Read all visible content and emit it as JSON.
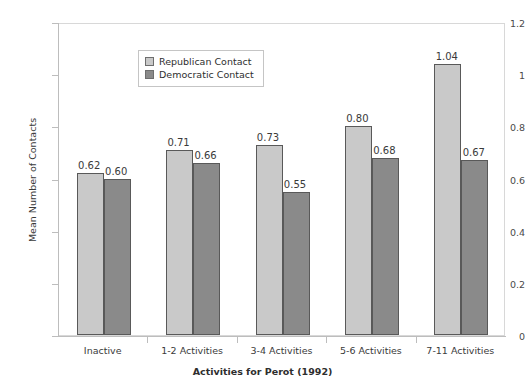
{
  "chart_data": {
    "type": "bar",
    "title": "",
    "subtitle": "",
    "xlabel": "Activities for Perot (1992)",
    "ylabel": "Mean Number of Contacts",
    "categories": [
      "Inactive",
      "1-2 Activities",
      "3-4 Activities",
      "5-6 Activities",
      "7-11 Activities"
    ],
    "series": [
      {
        "name": "Republican Contact",
        "color": "#c9c9c9",
        "values": [
          0.62,
          0.71,
          0.73,
          0.8,
          1.04
        ],
        "labels": [
          "0.62",
          "0.71",
          "0.73",
          "0.80",
          "1.04"
        ]
      },
      {
        "name": "Democratic Contact",
        "color": "#8a8a8a",
        "values": [
          0.6,
          0.66,
          0.55,
          0.68,
          0.67
        ],
        "labels": [
          "0.60",
          "0.66",
          "0.55",
          "0.68",
          "0.67"
        ]
      }
    ],
    "ylim": [
      0,
      1.2
    ],
    "yticks": [
      0,
      0.2,
      0.4,
      0.6,
      0.8,
      1,
      1.2
    ],
    "ytick_labels": [
      "0",
      "0.2",
      "0.4",
      "0.6",
      "0.8",
      "1",
      "1.2"
    ],
    "grid": false,
    "legend_position": "upper-left-inside",
    "bar_edge_color": "#595959",
    "axis_color": "#bdbdbd",
    "background": "#ffffff"
  },
  "legend": {
    "entries": [
      {
        "label": "Republican Contact",
        "swatch": "rep"
      },
      {
        "label": "Democratic Contact",
        "swatch": "dem"
      }
    ]
  }
}
